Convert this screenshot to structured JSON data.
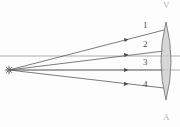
{
  "figure": {
    "kind": "optics-ray-diagram",
    "title": "",
    "background_color": "#fdfdfd",
    "width": 180,
    "height": 127
  },
  "colors": {
    "ray_stroke": "#5a5a5a",
    "axis_stroke": "#9a9a9a",
    "lens_fill": "#c9c9c9",
    "lens_stroke": "#7a7a7a",
    "label_text": "#4a4a4a",
    "faint_text": "#b8b8b8",
    "source_stroke": "#6a6a6a"
  },
  "source": {
    "name": "point-source",
    "x": 9,
    "y": 70,
    "glyph": "star-burst"
  },
  "lens": {
    "name": "biconvex-lens",
    "center_x": 166,
    "center_y": 61,
    "half_height": 39,
    "half_width": 9,
    "type": "converging"
  },
  "axes": [
    {
      "name": "upper-horizontal-axis",
      "x1": 0,
      "y1": 56,
      "x2": 180,
      "y2": 56
    },
    {
      "name": "optical-axis",
      "x1": 9,
      "y1": 70,
      "x2": 180,
      "y2": 70
    }
  ],
  "rays": [
    {
      "label": "1",
      "name": "ray-1",
      "x1": 9,
      "y1": 70,
      "x2": 164,
      "y2": 30,
      "arrow_t": 0.77,
      "label_x": 143,
      "label_y": 25
    },
    {
      "label": "2",
      "name": "ray-2",
      "x1": 9,
      "y1": 70,
      "x2": 164,
      "y2": 51,
      "arrow_t": 0.77,
      "label_x": 143,
      "label_y": 44
    },
    {
      "label": "3",
      "name": "ray-3",
      "x1": 9,
      "y1": 70,
      "x2": 164,
      "y2": 70,
      "arrow_t": 0.77,
      "label_x": 143,
      "label_y": 62
    },
    {
      "label": "4",
      "name": "ray-4",
      "x1": 9,
      "y1": 70,
      "x2": 164,
      "y2": 88,
      "arrow_t": 0.77,
      "label_x": 143,
      "label_y": 84
    }
  ],
  "marks": {
    "top": "V",
    "bottom": "A"
  }
}
